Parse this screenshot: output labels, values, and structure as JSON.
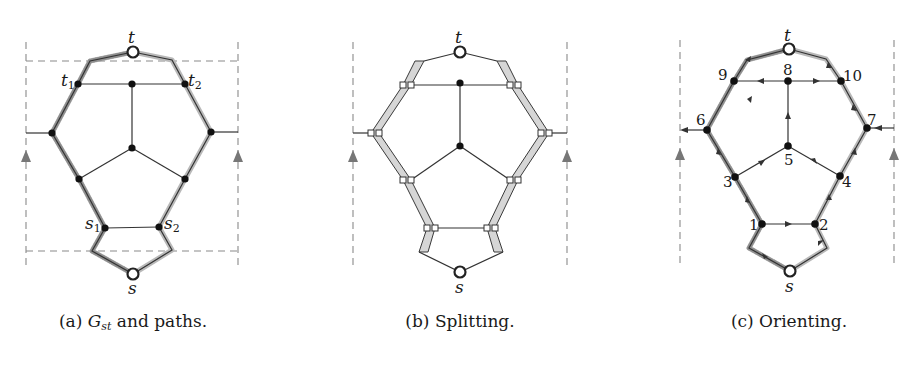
{
  "figure": {
    "panels": [
      {
        "id": "a",
        "caption_prefix": "(a)",
        "caption_math": "G",
        "caption_sub": "st",
        "caption_rest": " and paths.",
        "labels": {
          "t": "t",
          "s": "s",
          "t1": "t",
          "t1_sub": "1",
          "t2": "t",
          "t2_sub": "2",
          "s1": "s",
          "s1_sub": "1",
          "s2": "s",
          "s2_sub": "2"
        }
      },
      {
        "id": "b",
        "caption": "(b) Splitting.",
        "labels": {
          "t": "t",
          "s": "s"
        }
      },
      {
        "id": "c",
        "caption": "(c) Orienting.",
        "labels": {
          "t": "t",
          "s": "s",
          "n1": "1",
          "n2": "2",
          "n3": "3",
          "n4": "4",
          "n5": "5",
          "n6": "6",
          "n7": "7",
          "n8": "8",
          "n9": "9",
          "n10": "10"
        }
      }
    ],
    "colors": {
      "edge": "#333333",
      "path_highlight": "#b9b9b9",
      "split_band": "#d6d6d6",
      "dashed_boundary": "#8a8a8a",
      "arrow": "#777777"
    }
  }
}
